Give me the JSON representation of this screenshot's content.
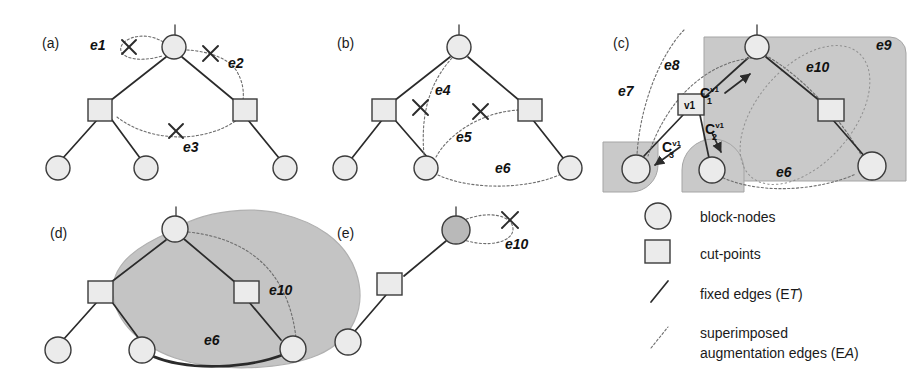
{
  "figure": {
    "width": 918,
    "height": 379,
    "background": "#ffffff"
  },
  "panels": [
    {
      "id": "a",
      "label": "(a)",
      "edge_labels": [
        "e1",
        "e2",
        "e3"
      ],
      "crossed_out_edges": [
        "e1",
        "e2",
        "e3"
      ]
    },
    {
      "id": "b",
      "label": "(b)",
      "edge_labels": [
        "e4",
        "e5",
        "e6"
      ],
      "crossed_out_edges": [
        "e4",
        "e5"
      ]
    },
    {
      "id": "c",
      "label": "(c)",
      "edge_labels": [
        "e7",
        "e8",
        "e9",
        "e10",
        "e6"
      ],
      "cut_point_label": "v1",
      "component_labels": [
        {
          "base": "C",
          "sup": "v1",
          "sub": "1"
        },
        {
          "base": "C",
          "sup": "v1",
          "sub": "2"
        },
        {
          "base": "C",
          "sup": "v1",
          "sub": "3"
        }
      ]
    },
    {
      "id": "d",
      "label": "(d)",
      "edge_labels": [
        "e10",
        "e6"
      ]
    },
    {
      "id": "e",
      "label": "(e)",
      "edge_labels": [
        "e10"
      ],
      "crossed_out_edges": [
        "e10"
      ]
    }
  ],
  "legend": {
    "items": [
      {
        "symbol": "circle-icon",
        "text": "block-nodes",
        "sub": ""
      },
      {
        "symbol": "square-icon",
        "text": "cut-points",
        "sub": ""
      },
      {
        "symbol": "solid-line-icon",
        "text": "fixed edges (E",
        "sub": "T",
        "tail": ")"
      },
      {
        "symbol": "dashed-line-icon",
        "text": "superimposed",
        "line2": "augmentation edges (E",
        "sub": "A",
        "tail": ")"
      }
    ]
  },
  "colors": {
    "node_fill": "#ebebeb",
    "node_fill_gray": "#b9b9b9",
    "region_fill": "#c9c9c9",
    "stroke": "#2b2b2b",
    "aug_stroke": "#6e6e6e"
  }
}
